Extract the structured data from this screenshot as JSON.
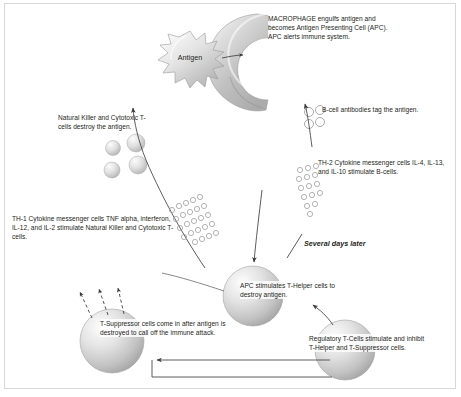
{
  "diagram": {
    "background": "#ffffff",
    "border_color": "#d8d8d8",
    "text_color": "#231f20"
  },
  "labels": {
    "macrophage": "MACROPHAGE engulfs antigen and becomes Antigen Presenting Cell (APC).  APC alerts immune system.",
    "antigen": "Antigen",
    "natural_killer": "Natural Killer and Cytotoxic T-cells destroy the antigen.",
    "b_cell": "B-cell antibodies tag the antigen.",
    "th2": "TH-2 Cytokine messenger cells IL-4, IL-13, and IL-10 stimulate B-cells.",
    "th1": "TH-1 Cytokine messenger cells TNF alpha, interferon, IL-12, and IL-2 stimulate Natural Killer and Cytotoxic T-cells.",
    "several_days_later": "Several days later",
    "apc": "APC stimulates T-Helper cells to destroy antigen.",
    "t_suppressor": "T-Suppressor cells come in after antigen is destroyed to call off the immune attack.",
    "regulatory": "Regulatory T-Cells stimulate and inhibit T-Helper and T-Suppressor cells."
  },
  "shapes": {
    "macrophage": {
      "name": "macrophage-cell",
      "fill_light": "#f2f2f2",
      "fill_dark": "#b9b9b9"
    },
    "antigen": {
      "name": "antigen-burst",
      "fill_light": "#f5f5f5",
      "fill_dark": "#bcbcbc"
    },
    "apc_cell": {
      "name": "apc-sphere",
      "cx": 253,
      "cy": 296,
      "r": 30
    },
    "t_suppressor_cell": {
      "name": "t-suppressor-sphere",
      "cx": 112,
      "cy": 341,
      "r": 32
    },
    "regulatory_cell": {
      "name": "regulatory-t-cell-sphere",
      "cx": 345,
      "cy": 350,
      "r": 30
    },
    "killer_cells": [
      {
        "cx": 113,
        "cy": 148,
        "r": 7.5
      },
      {
        "cx": 136,
        "cy": 143,
        "r": 9
      },
      {
        "cx": 112,
        "cy": 170,
        "r": 8
      },
      {
        "cx": 138,
        "cy": 165,
        "r": 9
      }
    ],
    "b_cell_antibodies": [
      {
        "cx": 309,
        "cy": 112,
        "r": 4.5
      },
      {
        "cx": 320,
        "cy": 110,
        "r": 4.5
      },
      {
        "cx": 309,
        "cy": 124,
        "r": 4.5
      },
      {
        "cx": 320,
        "cy": 122,
        "r": 4.5
      }
    ]
  },
  "cytokine_dots": {
    "name": "cytokine-messenger-dots",
    "radius": 2.6,
    "stroke": "#9a9a9a",
    "th1_cluster": [
      [
        172,
        210
      ],
      [
        179,
        206
      ],
      [
        186,
        203
      ],
      [
        193,
        200
      ],
      [
        200,
        197
      ],
      [
        176,
        219
      ],
      [
        183,
        215
      ],
      [
        190,
        212
      ],
      [
        197,
        209
      ],
      [
        204,
        206
      ],
      [
        180,
        228
      ],
      [
        187,
        224
      ],
      [
        194,
        221
      ],
      [
        201,
        218
      ],
      [
        208,
        215
      ],
      [
        184,
        237
      ],
      [
        191,
        233
      ],
      [
        198,
        230
      ],
      [
        205,
        227
      ],
      [
        212,
        224
      ],
      [
        195,
        242
      ],
      [
        202,
        239
      ],
      [
        209,
        236
      ],
      [
        216,
        233
      ]
    ],
    "th2_cluster": [
      [
        300,
        170
      ],
      [
        308,
        168
      ],
      [
        316,
        166
      ],
      [
        299,
        179
      ],
      [
        307,
        177
      ],
      [
        315,
        175
      ],
      [
        301,
        188
      ],
      [
        309,
        186
      ],
      [
        317,
        184
      ],
      [
        304,
        197
      ],
      [
        312,
        195
      ],
      [
        320,
        193
      ],
      [
        307,
        206
      ],
      [
        315,
        204
      ],
      [
        310,
        214
      ]
    ]
  },
  "arrows": {
    "antigen_to_macrophage": "solid",
    "nk_up_arrow": "solid",
    "b_cell_up_arrow": "solid",
    "apc_down_arrow": "solid",
    "apc_to_tsuppressor": "solid",
    "regulatory_to_tsuppressor": "solid",
    "regulatory_to_apc": "solid",
    "tsuppressor_dashed_count": 3
  }
}
